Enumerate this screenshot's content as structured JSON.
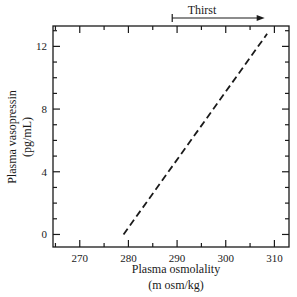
{
  "chart_data": {
    "type": "line",
    "title": "",
    "xlabel": "Plasma osmolality",
    "xlabel_units": "(m osm/kg)",
    "ylabel": "Plasma vasopressin",
    "ylabel_units": "(pg/mL)",
    "xlim": [
      264.5,
      313
    ],
    "ylim": [
      -0.8,
      13.3
    ],
    "x_ticks": [
      270,
      280,
      290,
      300,
      310
    ],
    "y_ticks": [
      0,
      4,
      8,
      12
    ],
    "grid": false,
    "legend": null,
    "series": [
      {
        "name": "Vasopressin vs osmolality",
        "style": "dashed",
        "x": [
          279,
          308.5
        ],
        "y": [
          0,
          12.8
        ]
      }
    ],
    "annotations": [
      {
        "type": "arrow",
        "label": "Thirst",
        "x_start": 289,
        "x_end": 308,
        "position": "above plot"
      }
    ]
  },
  "labels": {
    "x_title": "Plasma osmolality",
    "x_units": "(m osm/kg)",
    "y_title": "Plasma vasopressin",
    "y_units": "(pg/mL)",
    "thirst": "Thirst",
    "x_tick_labels": [
      "270",
      "280",
      "290",
      "300",
      "310"
    ],
    "y_tick_labels": [
      "0",
      "4",
      "8",
      "12"
    ]
  }
}
